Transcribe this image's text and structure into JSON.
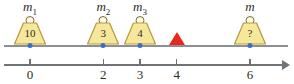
{
  "diagram": {
    "colors": {
      "weight_fill": "#f7e79a",
      "weight_stroke": "#b59a3e",
      "beam": "#8a8f94",
      "axis": "#6f7479",
      "dot": "#3a6fc4",
      "fulcrum": "#e8281c"
    },
    "weights": [
      {
        "label": "m",
        "subscript": "1",
        "value": "10",
        "position": 0
      },
      {
        "label": "m",
        "subscript": "2",
        "value": "3",
        "position": 2
      },
      {
        "label": "m",
        "subscript": "3",
        "value": "4",
        "position": 3
      },
      {
        "label": "m",
        "subscript": "",
        "value": "?",
        "position": 6
      }
    ],
    "fulcrum": {
      "position": 4,
      "shape": "triangle-up"
    },
    "axis": {
      "ticks": [
        {
          "label": "0",
          "position": 0
        },
        {
          "label": "2",
          "position": 2
        },
        {
          "label": "3",
          "position": 3
        },
        {
          "label": "4",
          "position": 4
        },
        {
          "label": "6",
          "position": 6
        }
      ],
      "arrow_end": "right"
    }
  }
}
